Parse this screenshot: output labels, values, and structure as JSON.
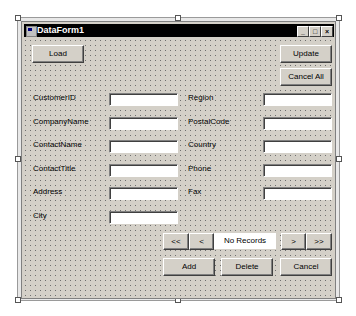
{
  "window": {
    "title": "DataForm1",
    "controls": {
      "minimize": "_",
      "maximize": "□",
      "close": "×"
    }
  },
  "toolbar": {
    "load_label": "Load",
    "update_label": "Update",
    "cancel_all_label": "Cancel All"
  },
  "fields_left": [
    {
      "label": "CustomerID",
      "value": ""
    },
    {
      "label": "CompanyName",
      "value": ""
    },
    {
      "label": "ContactName",
      "value": ""
    },
    {
      "label": "ContactTitle",
      "value": ""
    },
    {
      "label": "Address",
      "value": ""
    },
    {
      "label": "City",
      "value": ""
    }
  ],
  "fields_right": [
    {
      "label": "Region",
      "value": ""
    },
    {
      "label": "PostalCode",
      "value": ""
    },
    {
      "label": "Country",
      "value": ""
    },
    {
      "label": "Phone",
      "value": ""
    },
    {
      "label": "Fax",
      "value": ""
    }
  ],
  "navigation": {
    "first": "<<",
    "prev": "<",
    "status": "No Records",
    "next": ">",
    "last": ">>"
  },
  "actions": {
    "add_label": "Add",
    "delete_label": "Delete",
    "cancel_label": "Cancel"
  }
}
